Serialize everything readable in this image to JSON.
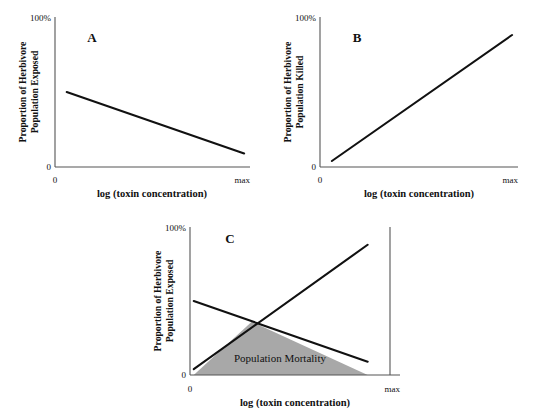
{
  "figure": {
    "background": "#ffffff",
    "line_color": "#111111",
    "axis_color": "#555555",
    "mortality_fill": "#a8a8a8"
  },
  "chart_data": [
    {
      "type": "line",
      "panel": "A",
      "title": "A",
      "xlabel": "log (toxin concentration)",
      "ylabel": "Proportion of Herbivore Population Exposed",
      "ylabel_line1": "Proportion of Herbivore",
      "ylabel_line2": "Population Exposed",
      "xticks": [
        "0",
        "max"
      ],
      "yticks": [
        "0",
        "100%"
      ],
      "xlim": [
        0,
        1
      ],
      "ylim": [
        0,
        100
      ],
      "grid": false,
      "legend": "none",
      "series": [
        {
          "name": "Proportion exposed",
          "x": [
            0.06,
            0.97
          ],
          "values": [
            50,
            9
          ]
        }
      ]
    },
    {
      "type": "line",
      "panel": "B",
      "title": "B",
      "xlabel": "log (toxin concentration)",
      "ylabel": "Proportion of Herbivore Population Killed",
      "ylabel_line1": "Proportion of Herbivore",
      "ylabel_line2": "Population Killed",
      "xticks": [
        "0",
        "max"
      ],
      "yticks": [
        "0",
        "100%"
      ],
      "xlim": [
        0,
        1
      ],
      "ylim": [
        0,
        100
      ],
      "grid": false,
      "legend": "none",
      "series": [
        {
          "name": "Proportion killed",
          "x": [
            0.06,
            0.97
          ],
          "values": [
            4,
            88
          ]
        }
      ]
    },
    {
      "type": "area",
      "panel": "C",
      "title": "C",
      "xlabel": "log (toxin concentration)",
      "ylabel": "Proportion of Herbivore Population Exposed",
      "ylabel_line1": "Proportion of Herbivore",
      "ylabel_line2": "Population Exposed",
      "xticks": [
        "0",
        "max"
      ],
      "yticks": [
        "0",
        "100%"
      ],
      "xlim": [
        0,
        1
      ],
      "ylim": [
        0,
        100
      ],
      "grid": false,
      "legend": "none",
      "area_label": "Population Mortality",
      "series": [
        {
          "name": "Proportion exposed",
          "x": [
            0.02,
            0.95
          ],
          "values": [
            50,
            9
          ]
        },
        {
          "name": "Proportion killed",
          "x": [
            0.02,
            0.95
          ],
          "values": [
            4,
            88
          ]
        }
      ],
      "intersection": {
        "x": 0.33,
        "y": 36
      }
    }
  ]
}
